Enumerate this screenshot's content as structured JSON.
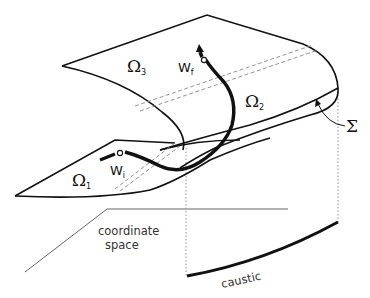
{
  "figure": {
    "colors": {
      "line": "#111111",
      "thin_line": "#666666",
      "dashed": "#888888",
      "background": "#ffffff"
    }
  },
  "labels": {
    "omega1": {
      "base": "Ω",
      "sub": "1"
    },
    "omega2": {
      "base": "Ω",
      "sub": "2"
    },
    "omega3": {
      "base": "Ω",
      "sub": "3"
    },
    "w_initial": {
      "base": "W",
      "sub": "i"
    },
    "w_final": {
      "base": "W",
      "sub": "f"
    },
    "sigma": "Σ",
    "coordinate_space_line1": "coordinate",
    "coordinate_space_line2": "space",
    "caustic": "caustic"
  }
}
